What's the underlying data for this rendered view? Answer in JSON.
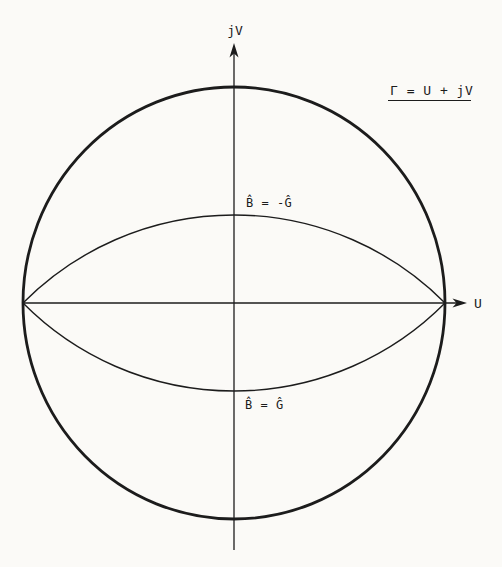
{
  "figure": {
    "axis_labels": {
      "vertical": "jV",
      "horizontal": "U"
    },
    "annotation": "Γ = U + jV",
    "curve_labels": {
      "upper": "B̂ = -Ĝ",
      "lower": "B̂ = Ĝ"
    },
    "colors": {
      "ink": "#1c1c1c",
      "paper": "#fbfaf7"
    }
  }
}
